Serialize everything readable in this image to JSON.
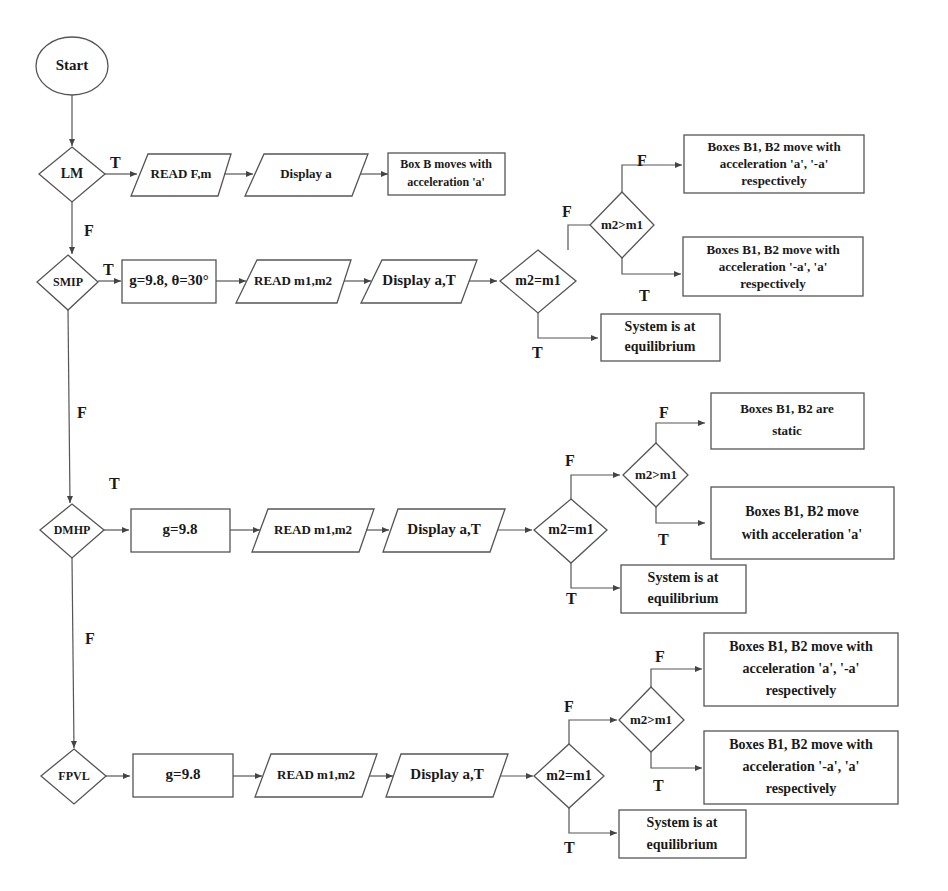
{
  "diagram": {
    "type": "flowchart",
    "start": "Start",
    "edge_labels": {
      "true": "T",
      "false": "F"
    },
    "rows": {
      "lm": {
        "decision": "LM",
        "steps": [
          "READ F,m",
          "Display a"
        ],
        "result": [
          "Box B moves with",
          "acceleration 'a'"
        ]
      },
      "smip": {
        "decision": "SMIP",
        "init": "g=9.8, θ=30°",
        "steps": [
          "READ m1,m2",
          "Display a,T"
        ],
        "eq_check": "m2=m1",
        "gt_check": "m2>m1",
        "gt_false": [
          "Boxes B1, B2  move with",
          "acceleration 'a', '-a'",
          "respectively"
        ],
        "gt_true": [
          "Boxes B1, B2  move with",
          "acceleration '-a', 'a'",
          "respectively"
        ],
        "eq_true": [
          "System is at",
          "equilibrium"
        ]
      },
      "dmhp": {
        "decision": "DMHP",
        "init": "g=9.8",
        "steps": [
          "READ m1,m2",
          "Display a,T"
        ],
        "eq_check": "m2=m1",
        "gt_check": "m2>m1",
        "gt_false": [
          "Boxes B1, B2  are",
          "static"
        ],
        "gt_true": [
          "Boxes B1, B2  move",
          "with acceleration 'a'"
        ],
        "eq_true": [
          "System is at",
          "equilibrium"
        ]
      },
      "fpvl": {
        "decision": "FPVL",
        "init": "g=9.8",
        "steps": [
          "READ m1,m2",
          "Display a,T"
        ],
        "eq_check": "m2=m1",
        "gt_check": "m2>m1",
        "gt_false": [
          "Boxes B1, B2  move with",
          "acceleration 'a', '-a'",
          "respectively"
        ],
        "gt_true": [
          "Boxes B1, B2  move with",
          "acceleration '-a', 'a'",
          "respectively"
        ],
        "eq_true": [
          "System is at",
          "equilibrium"
        ]
      }
    }
  }
}
